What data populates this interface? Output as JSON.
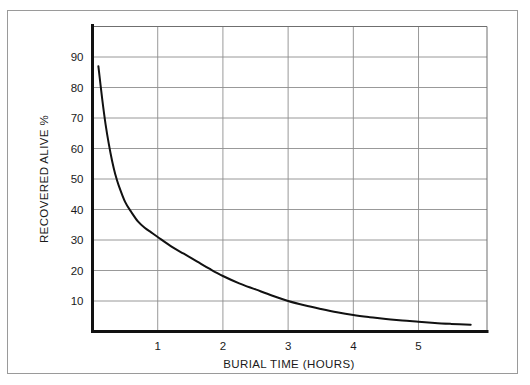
{
  "chart_data": {
    "type": "line",
    "title": "",
    "subtitle": "",
    "xlabel": "BURIAL TIME (HOURS)",
    "ylabel": "RECOVERED ALIVE %",
    "xlim": [
      0,
      6.05
    ],
    "ylim": [
      0,
      100
    ],
    "grid": true,
    "legend": "none",
    "x_ticks": [
      1,
      2,
      3,
      4,
      5
    ],
    "x_tick_labels": [
      "1",
      "2",
      "3",
      "4",
      "5"
    ],
    "y_ticks": [
      10,
      20,
      30,
      40,
      50,
      60,
      70,
      80,
      90
    ],
    "y_tick_labels": [
      "10",
      "20",
      "30",
      "40",
      "50",
      "60",
      "70",
      "80",
      "90"
    ],
    "series": [
      {
        "name": "Recovered alive",
        "color": "#111111",
        "x": [
          0.09,
          0.15,
          0.2,
          0.25,
          0.3,
          0.35,
          0.4,
          0.5,
          0.6,
          0.7,
          0.8,
          0.9,
          1.0,
          1.2,
          1.4,
          1.6,
          1.8,
          2.0,
          2.25,
          2.5,
          2.75,
          3.0,
          3.25,
          3.5,
          3.75,
          4.0,
          4.25,
          4.5,
          4.75,
          5.0,
          5.25,
          5.5,
          5.8
        ],
        "y": [
          87,
          76,
          68,
          61.5,
          56,
          51.5,
          48,
          42.5,
          39,
          36,
          34,
          32.5,
          31,
          28,
          25.5,
          23,
          20.5,
          18.2,
          15.8,
          13.8,
          11.8,
          10.0,
          8.6,
          7.4,
          6.3,
          5.4,
          4.7,
          4.1,
          3.6,
          3.2,
          2.8,
          2.5,
          2.2
        ]
      }
    ],
    "annotations": []
  },
  "axes": {
    "y_axis_title": "RECOVERED ALIVE %",
    "x_axis_title": "BURIAL TIME (HOURS)"
  },
  "colors": {
    "curve": "#111111",
    "gridline": "#8d8d8d",
    "axis": "#111111",
    "frame": "#9a9a9a",
    "background": "#ffffff",
    "text": "#1a1a1a"
  }
}
